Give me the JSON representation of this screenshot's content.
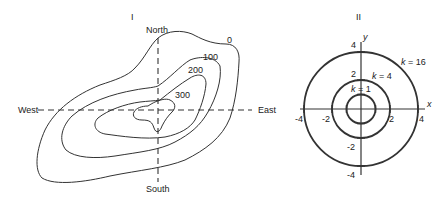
{
  "panel_1": {
    "title": "I",
    "axes": {
      "north": "North",
      "south": "South",
      "west": "West",
      "east": "East"
    },
    "contours": [
      {
        "label": "0"
      },
      {
        "label": "100"
      },
      {
        "label": "200"
      },
      {
        "label": "300"
      }
    ]
  },
  "panel_2": {
    "title": "II",
    "x_axis_label": "x",
    "y_axis_label": "y",
    "x_ticks": [
      "-4",
      "-2",
      "2",
      "4"
    ],
    "y_ticks": [
      "4",
      "2",
      "-2",
      "-4"
    ],
    "circles": [
      {
        "label": "k = 16",
        "k_var": "k",
        "eq": " = 16",
        "radius": 4
      },
      {
        "label": "k = 4",
        "k_var": "k",
        "eq": " = 4",
        "radius": 2
      },
      {
        "label": "k = 1",
        "k_var": "k",
        "eq": " = 1",
        "radius": 1
      }
    ]
  }
}
